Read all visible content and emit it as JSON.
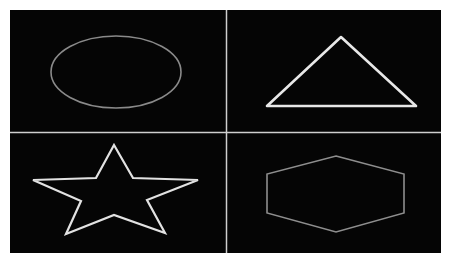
{
  "figure": {
    "background": "#ffffff",
    "panel_color": "#050505",
    "divider_color": "#cfcfcf",
    "panels": [
      {
        "id": "top-left",
        "shape": "ellipse",
        "stroke": "#8a8a8a",
        "stroke_width": 1.6,
        "cx": 116,
        "cy": 72,
        "rx": 65,
        "ry": 36
      },
      {
        "id": "top-right",
        "shape": "triangle",
        "stroke": "#e8e8e8",
        "stroke_width": 2.6,
        "points": "341,37 416,106 267,106"
      },
      {
        "id": "bottom-left",
        "shape": "star",
        "stroke": "#e2e2e2",
        "stroke_width": 2.2,
        "points": "114,145 133,178 198,180 147,200 165,233 114,215 66,234 81,201 33,180 96,178"
      },
      {
        "id": "bottom-right",
        "shape": "hexagon",
        "stroke": "#8e8e8e",
        "stroke_width": 1.6,
        "points": "336,156 404,174 404,213 336,232 267,213 267,174"
      }
    ]
  }
}
